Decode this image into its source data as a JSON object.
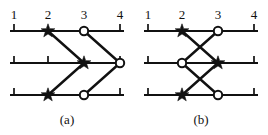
{
  "figure": {
    "width": 268,
    "height": 135,
    "background": "#ffffff",
    "ink_color": "#111111",
    "marker_fill_open": "#ffffff"
  },
  "panels": [
    {
      "id": "a",
      "caption": "(a)",
      "position_labels": [
        "1",
        "2",
        "3",
        "4"
      ],
      "position_x": [
        14,
        48,
        84,
        120
      ],
      "wire_y": [
        31,
        63,
        95
      ],
      "wire_x_start": 10,
      "wire_x_end": 124,
      "end_ticks": [
        {
          "x": 14,
          "row": 0
        },
        {
          "x": 120,
          "row": 0
        },
        {
          "x": 14,
          "row": 1
        },
        {
          "x": 120,
          "row": 1
        },
        {
          "x": 14,
          "row": 2
        },
        {
          "x": 120,
          "row": 2
        }
      ],
      "extra_ticks": [
        {
          "x": 48,
          "row": 1
        }
      ],
      "connectors": [
        {
          "from": {
            "row": 0,
            "pos": 2
          },
          "to": {
            "row": 1,
            "pos": 3
          },
          "kind": "star"
        },
        {
          "from": {
            "row": 0,
            "pos": 3
          },
          "to": {
            "row": 1,
            "pos": 4
          },
          "kind": "circle"
        },
        {
          "from": {
            "row": 2,
            "pos": 2
          },
          "to": {
            "row": 1,
            "pos": 3
          },
          "kind": "star"
        },
        {
          "from": {
            "row": 2,
            "pos": 3
          },
          "to": {
            "row": 1,
            "pos": 4
          },
          "kind": "circle"
        }
      ],
      "markers": [
        {
          "row": 0,
          "pos": 2,
          "type": "star"
        },
        {
          "row": 0,
          "pos": 3,
          "type": "circle"
        },
        {
          "row": 1,
          "pos": 3,
          "type": "star"
        },
        {
          "row": 1,
          "pos": 4,
          "type": "circle"
        },
        {
          "row": 2,
          "pos": 2,
          "type": "star"
        },
        {
          "row": 2,
          "pos": 3,
          "type": "circle"
        }
      ]
    },
    {
      "id": "b",
      "caption": "(b)",
      "position_labels": [
        "1",
        "2",
        "3",
        "4"
      ],
      "position_x": [
        14,
        48,
        84,
        120
      ],
      "wire_y": [
        31,
        63,
        95
      ],
      "wire_x_start": 10,
      "wire_x_end": 124,
      "end_ticks": [
        {
          "x": 14,
          "row": 0
        },
        {
          "x": 120,
          "row": 0
        },
        {
          "x": 14,
          "row": 1
        },
        {
          "x": 120,
          "row": 1
        },
        {
          "x": 14,
          "row": 2
        },
        {
          "x": 120,
          "row": 2
        }
      ],
      "extra_ticks": [],
      "connectors": [
        {
          "from": {
            "row": 0,
            "pos": 2
          },
          "to": {
            "row": 1,
            "pos": 3
          },
          "kind": "star"
        },
        {
          "from": {
            "row": 0,
            "pos": 3
          },
          "to": {
            "row": 1,
            "pos": 2
          },
          "kind": "circle"
        },
        {
          "from": {
            "row": 2,
            "pos": 2
          },
          "to": {
            "row": 1,
            "pos": 3
          },
          "kind": "star"
        },
        {
          "from": {
            "row": 1,
            "pos": 2
          },
          "to": {
            "row": 2,
            "pos": 3
          },
          "kind": "circle"
        }
      ],
      "markers": [
        {
          "row": 0,
          "pos": 2,
          "type": "star"
        },
        {
          "row": 0,
          "pos": 3,
          "type": "circle"
        },
        {
          "row": 1,
          "pos": 2,
          "type": "circle"
        },
        {
          "row": 1,
          "pos": 3,
          "type": "star"
        },
        {
          "row": 2,
          "pos": 2,
          "type": "star"
        },
        {
          "row": 2,
          "pos": 3,
          "type": "circle"
        }
      ]
    }
  ],
  "geometry": {
    "label_baseline_y": 19,
    "caption_y": 124,
    "caption_x": 67,
    "tick_height": 7,
    "star_radius": 7.2,
    "circle_radius": 4.2
  }
}
